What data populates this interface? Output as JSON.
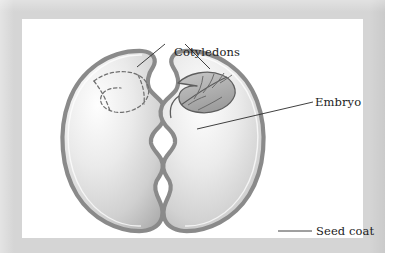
{
  "figure": {
    "kind": "botanical-diagram",
    "panel_background": "#ffffff",
    "frame_color": "#d5d5d5",
    "ink_color": "#1c1c1c"
  },
  "labels": {
    "cotyledons": "Cotyledons",
    "embryo": "Embryo",
    "seed_coat": "Seed coat"
  },
  "parts": [
    {
      "id": "left-cotyledon",
      "name": "Left cotyledon half",
      "fill_light": "#fdfdfd",
      "fill_dark": "#a9a9a9",
      "coat_color": "#8f8f8f"
    },
    {
      "id": "right-cotyledon",
      "name": "Right cotyledon half",
      "fill_light": "#fdfdfd",
      "fill_dark": "#a9a9a9",
      "coat_color": "#8f8f8f"
    },
    {
      "id": "embryo-leaf",
      "name": "Embryo plumule with veins",
      "fill": "#b4b4b4",
      "stroke": "#5e5e5e"
    },
    {
      "id": "embryo-imprint",
      "name": "Dashed embryo imprint on left half",
      "stroke": "#6f6f6f",
      "style": "dashed"
    },
    {
      "id": "seed-coat",
      "name": "Seed coat outer layer",
      "color": "#8f8f8f"
    }
  ],
  "leader_lines": [
    {
      "id": "cotyledons-left",
      "from_label": "Cotyledons",
      "to_part": "left-cotyledon"
    },
    {
      "id": "cotyledons-right",
      "from_label": "Cotyledons",
      "to_part": "right-cotyledon"
    },
    {
      "id": "embryo-line",
      "from_label": "Embryo",
      "to_part": "embryo-leaf"
    },
    {
      "id": "seedcoat-line",
      "from_label": "Seed coat",
      "to_part": "seed-coat"
    }
  ]
}
